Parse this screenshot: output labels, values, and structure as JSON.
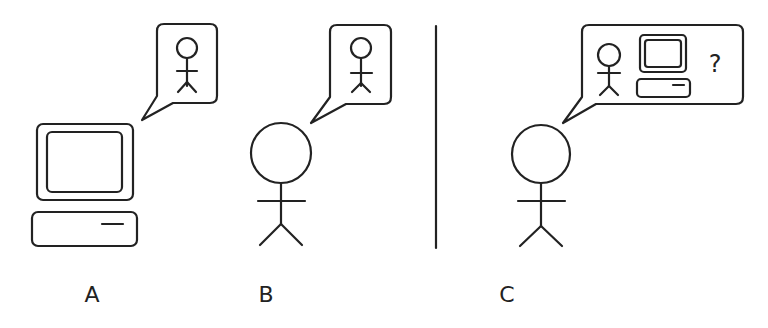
{
  "diagram": {
    "panels": [
      {
        "id": "A",
        "label": "A",
        "speaker": "computer",
        "thought": [
          "person"
        ]
      },
      {
        "id": "B",
        "label": "B",
        "speaker": "person",
        "thought": [
          "person"
        ]
      },
      {
        "id": "C",
        "label": "C",
        "speaker": "person",
        "thought": [
          "person",
          "computer",
          "question"
        ]
      }
    ],
    "question_mark": "?",
    "stroke_color": "#222222",
    "background": "#ffffff"
  }
}
